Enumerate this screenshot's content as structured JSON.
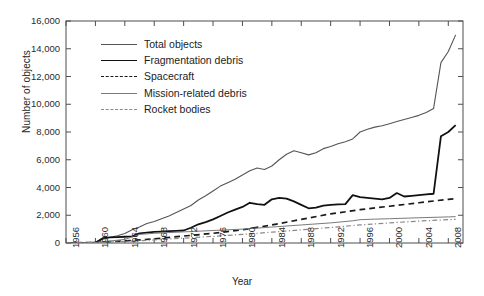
{
  "chart_data": {
    "type": "line",
    "title": "",
    "xlabel": "Year",
    "ylabel": "Number of objects",
    "xlim": [
      1956,
      2010
    ],
    "ylim": [
      0,
      16000
    ],
    "ytick_labels": [
      "0",
      "2,000",
      "4,000",
      "6,000",
      "8,000",
      "10,000",
      "12,000",
      "14,000",
      "16,000"
    ],
    "ytick_values": [
      0,
      2000,
      4000,
      6000,
      8000,
      10000,
      12000,
      14000,
      16000
    ],
    "xtick_labels": [
      "1956",
      "1960",
      "1964",
      "1968",
      "1972",
      "1976",
      "1980",
      "1984",
      "1988",
      "1992",
      "1996",
      "2000",
      "2004",
      "2008"
    ],
    "xtick_values": [
      1956,
      1960,
      1964,
      1968,
      1972,
      1976,
      1980,
      1984,
      1988,
      1992,
      1996,
      2000,
      2004,
      2008
    ],
    "grid": false,
    "legend_position": "upper-left-inside",
    "series": [
      {
        "name": "Total objects",
        "color": "#555555",
        "style": "solid",
        "width": 1.1,
        "x": [
          1956,
          1957,
          1958,
          1959,
          1960,
          1961,
          1962,
          1963,
          1964,
          1965,
          1966,
          1967,
          1968,
          1969,
          1970,
          1971,
          1972,
          1973,
          1974,
          1975,
          1976,
          1977,
          1978,
          1979,
          1980,
          1981,
          1982,
          1983,
          1984,
          1985,
          1986,
          1987,
          1988,
          1989,
          1990,
          1991,
          1992,
          1993,
          1994,
          1995,
          1996,
          1997,
          1998,
          1999,
          2000,
          2001,
          2002,
          2003,
          2004,
          2005,
          2006,
          2007,
          2008,
          2009
        ],
        "values": [
          0,
          5,
          20,
          40,
          60,
          280,
          420,
          520,
          680,
          950,
          1150,
          1400,
          1550,
          1750,
          1950,
          2200,
          2450,
          2700,
          3100,
          3400,
          3750,
          4100,
          4350,
          4600,
          4900,
          5200,
          5400,
          5300,
          5550,
          6000,
          6400,
          6650,
          6500,
          6350,
          6500,
          6800,
          6950,
          7150,
          7300,
          7500,
          8000,
          8200,
          8350,
          8450,
          8600,
          8750,
          8900,
          9050,
          9200,
          9400,
          9700,
          13000,
          13800,
          15000
        ]
      },
      {
        "name": "Fragmentation debris",
        "color": "#111111",
        "style": "solid",
        "width": 1.8,
        "x": [
          1956,
          1958,
          1960,
          1961,
          1962,
          1963,
          1964,
          1965,
          1966,
          1967,
          1968,
          1969,
          1970,
          1971,
          1972,
          1973,
          1974,
          1975,
          1976,
          1977,
          1978,
          1979,
          1980,
          1981,
          1982,
          1983,
          1984,
          1985,
          1986,
          1987,
          1988,
          1989,
          1990,
          1991,
          1992,
          1993,
          1994,
          1995,
          1996,
          1997,
          1998,
          1999,
          2000,
          2001,
          2002,
          2003,
          2004,
          2005,
          2006,
          2007,
          2008,
          2009
        ],
        "values": [
          0,
          0,
          10,
          350,
          400,
          420,
          450,
          480,
          700,
          750,
          800,
          820,
          850,
          870,
          900,
          1100,
          1350,
          1500,
          1700,
          1950,
          2200,
          2400,
          2600,
          2900,
          2800,
          2750,
          3150,
          3250,
          3200,
          3000,
          2750,
          2500,
          2550,
          2700,
          2750,
          2780,
          2800,
          3450,
          3300,
          3250,
          3200,
          3150,
          3250,
          3600,
          3350,
          3400,
          3450,
          3500,
          3550,
          7700,
          8000,
          8500
        ]
      },
      {
        "name": "Spacecraft",
        "color": "#1a1a1a",
        "style": "dashed",
        "width": 1.7,
        "x": [
          1956,
          1960,
          1964,
          1968,
          1972,
          1976,
          1980,
          1984,
          1988,
          1992,
          1996,
          2000,
          2004,
          2008,
          2009
        ],
        "values": [
          0,
          40,
          150,
          300,
          500,
          700,
          950,
          1300,
          1700,
          2100,
          2400,
          2650,
          2900,
          3150,
          3200
        ]
      },
      {
        "name": "Mission-related debris",
        "color": "#7a7a7a",
        "style": "solid",
        "width": 1.0,
        "x": [
          1956,
          1960,
          1964,
          1966,
          1968,
          1972,
          1976,
          1980,
          1984,
          1988,
          1992,
          1995,
          1996,
          1998,
          2000,
          2004,
          2008,
          2009
        ],
        "values": [
          0,
          30,
          260,
          620,
          700,
          800,
          900,
          1000,
          1150,
          1300,
          1450,
          1600,
          1680,
          1720,
          1750,
          1820,
          1880,
          1900
        ]
      },
      {
        "name": "Rocket bodies",
        "color": "#8a8a8a",
        "style": "dashdot",
        "width": 1.2,
        "x": [
          1956,
          1960,
          1964,
          1968,
          1972,
          1976,
          1980,
          1984,
          1988,
          1992,
          1996,
          2000,
          2004,
          2008,
          2009
        ],
        "values": [
          0,
          20,
          110,
          220,
          350,
          480,
          620,
          780,
          950,
          1120,
          1300,
          1450,
          1580,
          1680,
          1700
        ]
      }
    ]
  },
  "legend": {
    "items": [
      {
        "label": "Total objects"
      },
      {
        "label": "Fragmentation debris"
      },
      {
        "label": "Spacecraft"
      },
      {
        "label": "Mission-related debris"
      },
      {
        "label": "Rocket bodies"
      }
    ]
  }
}
